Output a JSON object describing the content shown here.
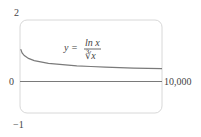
{
  "chart_data": {
    "type": "line",
    "title": "",
    "xlabel": "",
    "ylabel": "",
    "xlim": [
      0,
      10000
    ],
    "ylim": [
      -1,
      2
    ],
    "grid": false,
    "tick_labels": {
      "y_top": "2",
      "y_zero": "0",
      "y_bottom": "−1",
      "x_right": "10,000"
    },
    "annotation": {
      "lhs": "y =",
      "numerator": "ln x",
      "denominator": "∛x",
      "text": "y = ln x / ∛x"
    },
    "series": [
      {
        "name": "y = ln x / ∛x",
        "x": [
          1,
          50,
          150,
          300,
          600,
          1000,
          2000,
          3000,
          4000,
          5000,
          6000,
          7000,
          8000,
          9000,
          10000
        ],
        "values": [
          0.0,
          1.06,
          0.94,
          0.85,
          0.76,
          0.69,
          0.6,
          0.56,
          0.52,
          0.5,
          0.48,
          0.46,
          0.45,
          0.44,
          0.43
        ]
      }
    ],
    "colors": {
      "curve": "#7a7a7a",
      "axis": "#7a7a7a",
      "frame": "#d8d8d8"
    }
  }
}
